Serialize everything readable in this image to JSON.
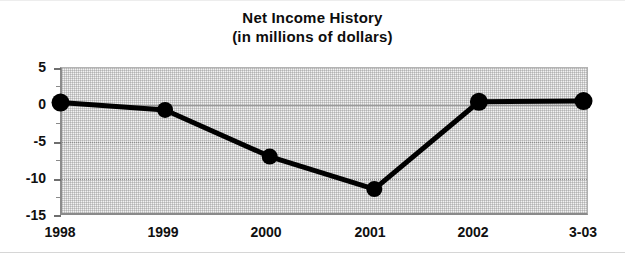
{
  "chart_data": {
    "type": "line",
    "title": "Net Income History",
    "subtitle": "(in millions of dollars)",
    "xlabel": "",
    "ylabel": "",
    "categories": [
      "1998",
      "1999",
      "2000",
      "2001",
      "2002",
      "3-03"
    ],
    "values": [
      0.2,
      -0.8,
      -7.1,
      -11.5,
      0.3,
      0.4
    ],
    "series": [
      {
        "name": "Net Income",
        "values": [
          0.2,
          -0.8,
          -7.1,
          -11.5,
          0.3,
          0.4
        ]
      }
    ],
    "ylim": [
      -15,
      5
    ],
    "ytick_labels": [
      "5",
      "0",
      "-5",
      "-10",
      "-15"
    ],
    "ytick_values": [
      5,
      0,
      -5,
      -10,
      -15
    ],
    "yminor_tick_values": [
      2.5,
      -2.5,
      -7.5,
      -12.5
    ],
    "grid": true,
    "gridlines_at": [
      0,
      -5,
      -10
    ],
    "legend": "none",
    "marker": "filled-circle",
    "line_color": "#000000",
    "marker_color": "#000000",
    "plot_background": "#f2f2f2"
  },
  "figure": {
    "title_lines": [
      "Net Income History",
      "(in millions of dollars)"
    ]
  }
}
